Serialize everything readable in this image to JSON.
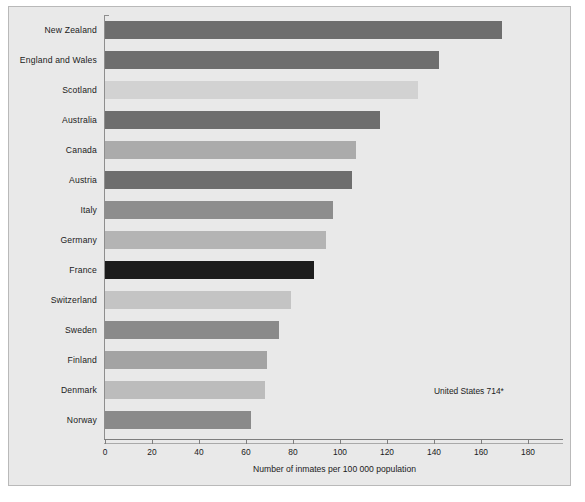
{
  "chart_data": {
    "type": "bar",
    "orientation": "horizontal",
    "title": "",
    "xlabel": "Number of inmates per 100 000 population",
    "ylabel": "",
    "xlim": [
      0,
      195
    ],
    "grid": false,
    "legend": null,
    "xticks": [
      0,
      20,
      40,
      60,
      80,
      100,
      120,
      140,
      160,
      180
    ],
    "xtick_labels": [
      "0",
      "20",
      "40",
      "60",
      "80",
      "100",
      "120",
      "140",
      "160",
      "180"
    ],
    "categories": [
      "New Zealand",
      "England and Wales",
      "Scotland",
      "Australia",
      "Canada",
      "Austria",
      "Italy",
      "Germany",
      "France",
      "Switzerland",
      "Sweden",
      "Finland",
      "Denmark",
      "Norway"
    ],
    "values": [
      169,
      142,
      133,
      117,
      107,
      105,
      97,
      94,
      89,
      79,
      74,
      69,
      68,
      62
    ],
    "bar_colors": [
      "#6e6e6e",
      "#6e6e6e",
      "#d2d2d2",
      "#6e6e6e",
      "#ababab",
      "#6e6e6e",
      "#8d8d8d",
      "#b4b4b4",
      "#1c1c1c",
      "#c4c4c4",
      "#8a8a8a",
      "#a3a3a3",
      "#bcbcbc",
      "#8a8a8a"
    ],
    "annotations": [
      {
        "text": "United States 714*",
        "x": 140,
        "y_category": "Denmark"
      }
    ]
  },
  "figure": {
    "background_color": "#e9e9e9",
    "border_color": "#b9b9b9",
    "axis_color": "#7e7e7e",
    "text_color": "#1b1b1b"
  }
}
